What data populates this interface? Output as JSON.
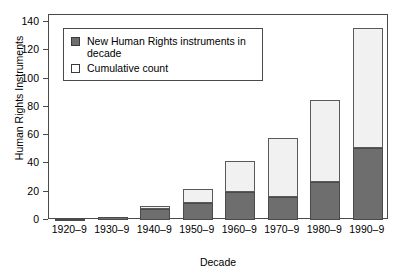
{
  "chart_data": {
    "type": "bar",
    "stacked": true,
    "title": "",
    "xlabel": "Decade",
    "ylabel": "Human Rights Instruments",
    "categories": [
      "1920–9",
      "1930–9",
      "1940–9",
      "1950–9",
      "1960–9",
      "1970–9",
      "1980–9",
      "1990–9"
    ],
    "series": [
      {
        "name": "New Human Rights instruments in decade",
        "color": "#6e6e6e",
        "values": [
          1,
          2,
          8,
          12,
          20,
          16,
          27,
          51
        ]
      },
      {
        "name": "Cumulative count",
        "color": "#f1f1f1",
        "values": [
          1,
          2,
          10,
          22,
          42,
          58,
          85,
          136
        ]
      }
    ],
    "ylim": [
      0,
      145
    ],
    "yticks": [
      0,
      20,
      40,
      60,
      80,
      100,
      120,
      140
    ],
    "ytick_labels": [
      "0",
      "20",
      "40",
      "60",
      "80",
      "100",
      "120",
      "140"
    ],
    "grid": false,
    "legend_position": "top-left"
  },
  "legend": {
    "items": [
      {
        "swatch": "filled-gray-square",
        "label_line1": "New Human Rights instruments in",
        "label_line2": "decade"
      },
      {
        "swatch": "open-white-square",
        "label_line1": "Cumulative count",
        "label_line2": ""
      }
    ]
  }
}
